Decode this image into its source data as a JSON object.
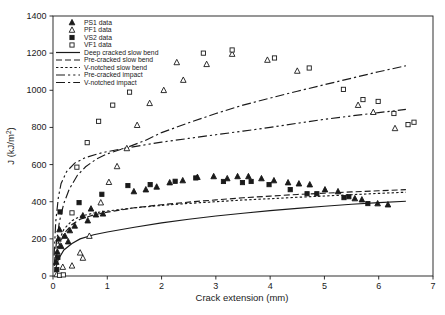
{
  "figure": {
    "background": "#ffffff",
    "ink_color": "#1a1a1a",
    "x_axis": {
      "title": "Crack extension (mm)",
      "ticks": [
        0,
        1,
        2,
        3,
        4,
        5,
        6,
        7
      ],
      "range": [
        0,
        7
      ]
    },
    "y_axis": {
      "title_main": "J (kJ/m",
      "title_sup": "2",
      "title_end": ")",
      "ticks": [
        0,
        200,
        400,
        600,
        800,
        1000,
        1200,
        1400
      ],
      "range": [
        0,
        1400
      ]
    }
  },
  "chart_data": {
    "type": "scatter",
    "title": "",
    "xlabel": "Crack extension (mm)",
    "ylabel": "J (kJ/m^2)",
    "xlim": [
      0,
      7
    ],
    "ylim": [
      0,
      1400
    ],
    "grid": false,
    "legend_position": "top-left-inside",
    "series": [
      {
        "name": "PS1 data",
        "marker": "triangle",
        "fill": "filled",
        "points": [
          [
            0.06,
            75
          ],
          [
            0.08,
            130
          ],
          [
            0.1,
            200
          ],
          [
            0.12,
            250
          ],
          [
            0.15,
            160
          ],
          [
            0.22,
            215
          ],
          [
            0.28,
            185
          ],
          [
            0.31,
            245
          ],
          [
            0.4,
            270
          ],
          [
            0.55,
            325
          ],
          [
            0.64,
            298
          ],
          [
            0.7,
            362
          ],
          [
            0.79,
            330
          ],
          [
            0.92,
            335
          ],
          [
            1.49,
            455
          ],
          [
            1.71,
            465
          ],
          [
            1.91,
            480
          ],
          [
            2.15,
            503
          ],
          [
            2.39,
            514
          ],
          [
            2.66,
            532
          ],
          [
            2.96,
            536
          ],
          [
            3.21,
            525
          ],
          [
            3.4,
            536
          ],
          [
            3.6,
            536
          ],
          [
            3.84,
            525
          ],
          [
            4.07,
            514
          ],
          [
            4.33,
            503
          ],
          [
            4.53,
            497
          ],
          [
            4.73,
            492
          ],
          [
            5.01,
            465
          ],
          [
            5.25,
            455
          ],
          [
            5.56,
            417
          ],
          [
            5.69,
            411
          ],
          [
            5.98,
            390
          ],
          [
            6.17,
            384
          ]
        ]
      },
      {
        "name": "PF1 data",
        "marker": "triangle",
        "fill": "open",
        "points": [
          [
            0.07,
            8
          ],
          [
            0.18,
            48
          ],
          [
            0.35,
            55
          ],
          [
            0.5,
            125
          ],
          [
            0.55,
            97
          ],
          [
            0.67,
            215
          ],
          [
            0.88,
            395
          ],
          [
            1.03,
            505
          ],
          [
            1.18,
            590
          ],
          [
            1.36,
            687
          ],
          [
            1.55,
            812
          ],
          [
            1.78,
            930
          ],
          [
            2.04,
            1000
          ],
          [
            2.28,
            1150
          ],
          [
            2.4,
            1055
          ],
          [
            2.83,
            1140
          ],
          [
            3.3,
            1195
          ],
          [
            3.95,
            1163
          ],
          [
            4.5,
            1104
          ],
          [
            5.62,
            920
          ],
          [
            5.9,
            882
          ],
          [
            6.3,
            795
          ]
        ]
      },
      {
        "name": "VS2 data",
        "marker": "square",
        "fill": "filled",
        "points": [
          [
            0.07,
            35
          ],
          [
            0.09,
            100
          ],
          [
            0.13,
            345
          ],
          [
            0.48,
            395
          ],
          [
            0.9,
            440
          ],
          [
            1.38,
            487
          ],
          [
            1.79,
            492
          ],
          [
            2.25,
            510
          ],
          [
            2.63,
            528
          ],
          [
            3.14,
            509
          ],
          [
            3.49,
            503
          ],
          [
            3.65,
            509
          ],
          [
            3.98,
            492
          ],
          [
            4.37,
            465
          ],
          [
            4.68,
            443
          ],
          [
            4.86,
            443
          ],
          [
            5.36,
            422
          ],
          [
            5.45,
            427
          ],
          [
            5.8,
            390
          ]
        ]
      },
      {
        "name": "VF1 data",
        "marker": "square",
        "fill": "open",
        "points": [
          [
            0.12,
            4
          ],
          [
            0.19,
            6
          ],
          [
            0.35,
            340
          ],
          [
            0.44,
            586
          ],
          [
            0.63,
            718
          ],
          [
            0.84,
            833
          ],
          [
            1.1,
            920
          ],
          [
            1.41,
            990
          ],
          [
            2.77,
            1200
          ],
          [
            3.3,
            1217
          ],
          [
            4.08,
            1174
          ],
          [
            4.72,
            1120
          ],
          [
            5.35,
            1005
          ],
          [
            5.71,
            950
          ],
          [
            5.99,
            940
          ],
          [
            6.28,
            875
          ],
          [
            6.54,
            815
          ],
          [
            6.65,
            828
          ]
        ]
      }
    ],
    "curves": [
      {
        "name": "Deep cracked slow bend",
        "style": "solid",
        "dash": "",
        "points": [
          [
            0.03,
            20
          ],
          [
            0.1,
            90
          ],
          [
            0.2,
            140
          ],
          [
            0.35,
            175
          ],
          [
            0.5,
            200
          ],
          [
            0.75,
            222
          ],
          [
            1,
            237
          ],
          [
            1.5,
            263
          ],
          [
            2,
            286
          ],
          [
            2.5,
            306
          ],
          [
            3,
            323
          ],
          [
            3.5,
            338
          ],
          [
            4,
            352
          ],
          [
            4.5,
            364
          ],
          [
            5,
            376
          ],
          [
            5.5,
            386
          ],
          [
            6,
            395
          ],
          [
            6.5,
            403
          ]
        ]
      },
      {
        "name": "Pre-cracked slow bend",
        "style": "long-dash",
        "dash": "6,3",
        "points": [
          [
            0.03,
            55
          ],
          [
            0.1,
            155
          ],
          [
            0.2,
            228
          ],
          [
            0.35,
            278
          ],
          [
            0.5,
            306
          ],
          [
            0.75,
            329
          ],
          [
            1,
            344
          ],
          [
            1.5,
            367
          ],
          [
            2,
            384
          ],
          [
            2.5,
            398
          ],
          [
            3,
            410
          ],
          [
            3.5,
            421
          ],
          [
            4,
            430
          ],
          [
            4.5,
            439
          ],
          [
            5,
            446
          ],
          [
            5.5,
            453
          ],
          [
            6,
            459
          ],
          [
            6.5,
            465
          ]
        ]
      },
      {
        "name": "V-notched slow bend",
        "style": "short-dash",
        "dash": "2.4,2.2",
        "points": [
          [
            0.03,
            75
          ],
          [
            0.1,
            182
          ],
          [
            0.2,
            252
          ],
          [
            0.35,
            298
          ],
          [
            0.5,
            321
          ],
          [
            0.75,
            339
          ],
          [
            1,
            350
          ],
          [
            1.5,
            367
          ],
          [
            2,
            380
          ],
          [
            2.5,
            391
          ],
          [
            3,
            400
          ],
          [
            3.5,
            409
          ],
          [
            4,
            416
          ],
          [
            4.5,
            424
          ],
          [
            5,
            431
          ],
          [
            5.5,
            438
          ],
          [
            6,
            445
          ],
          [
            6.5,
            451
          ]
        ]
      },
      {
        "name": "Pre-cracked impact",
        "style": "dash-dot-dot",
        "dash": "9,3,2.2,3,2.2,3",
        "points": [
          [
            0.02,
            110
          ],
          [
            0.05,
            290
          ],
          [
            0.1,
            425
          ],
          [
            0.15,
            498
          ],
          [
            0.25,
            562
          ],
          [
            0.4,
            608
          ],
          [
            0.6,
            638
          ],
          [
            0.9,
            664
          ],
          [
            1.35,
            689
          ],
          [
            2,
            721
          ],
          [
            2.5,
            741
          ],
          [
            3,
            761
          ],
          [
            3.5,
            780
          ],
          [
            4,
            800
          ],
          [
            4.5,
            822
          ],
          [
            5,
            844
          ],
          [
            5.5,
            862
          ],
          [
            6,
            880
          ],
          [
            6.5,
            897
          ]
        ]
      },
      {
        "name": "V-notched impact",
        "style": "dash-dot",
        "dash": "9,3,2.2,3",
        "points": [
          [
            0.02,
            55
          ],
          [
            0.06,
            175
          ],
          [
            0.12,
            295
          ],
          [
            0.2,
            392
          ],
          [
            0.3,
            468
          ],
          [
            0.45,
            542
          ],
          [
            0.6,
            588
          ],
          [
            0.8,
            630
          ],
          [
            1,
            658
          ],
          [
            1.35,
            691
          ],
          [
            1.7,
            730
          ],
          [
            2,
            772
          ],
          [
            2.5,
            825
          ],
          [
            3,
            875
          ],
          [
            3.5,
            920
          ],
          [
            4,
            958
          ],
          [
            4.5,
            995
          ],
          [
            5,
            1030
          ],
          [
            5.5,
            1065
          ],
          [
            6,
            1100
          ],
          [
            6.5,
            1132
          ]
        ]
      }
    ]
  }
}
